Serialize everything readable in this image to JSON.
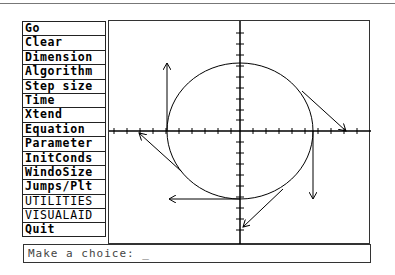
{
  "menu": {
    "items": [
      {
        "label": "Go"
      },
      {
        "label": "Clear"
      },
      {
        "label": "Dimension"
      },
      {
        "label": "Algorithm"
      },
      {
        "label": "Step size"
      },
      {
        "label": "Time"
      },
      {
        "label": "Xtend"
      },
      {
        "label": "Equation"
      },
      {
        "label": "Parameter"
      },
      {
        "label": "InitConds"
      },
      {
        "label": "WindoSize"
      },
      {
        "label": "Jumps/Plt"
      },
      {
        "label": "UTILITIES"
      },
      {
        "label": "VISUALAID"
      },
      {
        "label": "Quit"
      }
    ]
  },
  "plot": {
    "description": "Phase plot: circle trajectory centered at origin with tangent velocity vectors",
    "axes_color": "#000000"
  },
  "prompt": {
    "text": "Make a choice: _"
  }
}
